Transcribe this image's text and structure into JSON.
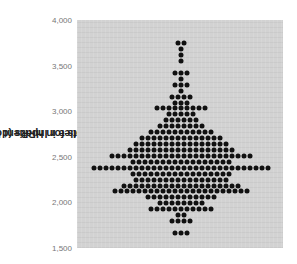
{
  "chart_data": {
    "type": "scatter",
    "subtype": "beeswarm",
    "title": "",
    "xlabel": "",
    "ylabel": "Reimbursements for Inpatient Hospital Services per Enrollee in HRRs (dollars)",
    "ylabel_lines": [
      "Reimbursements for Inpatient Hospital Services per",
      "Enrollee in HRRs (dollars)"
    ],
    "ylim": [
      1500,
      4000
    ],
    "yticks": [
      1500,
      2000,
      2500,
      3000,
      3500,
      4000
    ],
    "ytick_labels": [
      "1,500",
      "2,000",
      "2,500",
      "3,000",
      "3,500",
      "4,000"
    ],
    "grid": false,
    "legend": null,
    "bin_width": 66,
    "rows": [
      {
        "y": 3750,
        "count": 2
      },
      {
        "y": 3685,
        "count": 1
      },
      {
        "y": 3620,
        "count": 1
      },
      {
        "y": 3555,
        "count": 1
      },
      {
        "y": 3420,
        "count": 3
      },
      {
        "y": 3355,
        "count": 1
      },
      {
        "y": 3290,
        "count": 3
      },
      {
        "y": 3225,
        "count": 1
      },
      {
        "y": 3160,
        "count": 4
      },
      {
        "y": 3095,
        "count": 3
      },
      {
        "y": 3030,
        "count": 9
      },
      {
        "y": 2965,
        "count": 5
      },
      {
        "y": 2900,
        "count": 6
      },
      {
        "y": 2835,
        "count": 8
      },
      {
        "y": 2770,
        "count": 11
      },
      {
        "y": 2705,
        "count": 14
      },
      {
        "y": 2640,
        "count": 16
      },
      {
        "y": 2575,
        "count": 18
      },
      {
        "y": 2510,
        "count": 24
      },
      {
        "y": 2445,
        "count": 17
      },
      {
        "y": 2380,
        "count": 30
      },
      {
        "y": 2315,
        "count": 17
      },
      {
        "y": 2250,
        "count": 16
      },
      {
        "y": 2185,
        "count": 20
      },
      {
        "y": 2120,
        "count": 23
      },
      {
        "y": 2055,
        "count": 12
      },
      {
        "y": 1990,
        "count": 8
      },
      {
        "y": 1925,
        "count": 11
      },
      {
        "y": 1860,
        "count": 2
      },
      {
        "y": 1795,
        "count": 4
      },
      {
        "y": 1665,
        "count": 3
      }
    ]
  },
  "colors": {
    "plot_bg": "#d2d2d2",
    "dot": "#111111",
    "tick_text": "#777777",
    "label_text": "#222222"
  }
}
